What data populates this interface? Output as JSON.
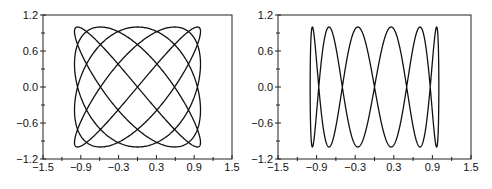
{
  "chart_data": [
    {
      "type": "line",
      "title": "",
      "xlabel": "",
      "ylabel": "",
      "xlim": [
        -1.5,
        1.5
      ],
      "ylim": [
        -1.2,
        1.2
      ],
      "xticks": [
        -1.5,
        -0.9,
        -0.3,
        0.3,
        0.9,
        1.5
      ],
      "xtick_labels": [
        "-1.5",
        "-0.9",
        "-0.3",
        "0.3",
        "0.9",
        "1.5"
      ],
      "xminor_ticks": [
        -1.2,
        -0.6,
        0.0,
        0.6,
        1.2
      ],
      "yticks": [
        -1.2,
        -0.6,
        0.0,
        0.6,
        1.2
      ],
      "ytick_labels": [
        "-1.2",
        "-0.6",
        "0.0",
        "0.6",
        "1.2"
      ],
      "yminor_ticks": [
        -0.9,
        -0.3,
        0.3,
        0.9
      ],
      "grid": false,
      "legend": null,
      "series": [
        {
          "name": "lissajous-5-4",
          "parametric": {
            "x": "sin(4t)",
            "y": "sin(5t + pi/4)",
            "t_range": [
              0,
              6.2832
            ],
            "a": 4,
            "b": 5,
            "phase": 0.7854
          }
        }
      ]
    },
    {
      "type": "line",
      "title": "",
      "xlabel": "",
      "ylabel": "",
      "xlim": [
        -1.5,
        1.5
      ],
      "ylim": [
        -1.2,
        1.2
      ],
      "xticks": [
        -1.5,
        -0.9,
        -0.3,
        0.3,
        0.9,
        1.5
      ],
      "xtick_labels": [
        "-1.5",
        "-0.9",
        "-0.3",
        "0.3",
        "0.9",
        "1.5"
      ],
      "xminor_ticks": [
        -1.2,
        -0.6,
        0.0,
        0.6,
        1.2
      ],
      "yticks": [
        -1.2,
        -0.6,
        0.0,
        0.6,
        1.2
      ],
      "ytick_labels": [
        "-1.2",
        "-0.6",
        "0.0",
        "0.6",
        "1.2"
      ],
      "yminor_ticks": [
        -0.9,
        -0.3,
        0.3,
        0.9
      ],
      "grid": false,
      "legend": null,
      "series": [
        {
          "name": "lissajous-1-6",
          "parametric": {
            "x": "cos(t)",
            "y": "sin(6t)",
            "t_range": [
              0,
              6.2832
            ],
            "a": 1,
            "b": 6,
            "phase": 0
          },
          "peak_x_positions": [
            -0.97,
            -0.71,
            -0.26,
            0.26,
            0.71,
            0.97
          ]
        }
      ]
    }
  ],
  "layout": {
    "panels": [
      {
        "left": 43,
        "top": 15,
        "width": 189,
        "height": 144
      },
      {
        "left": 278,
        "top": 15,
        "width": 193,
        "height": 144
      }
    ],
    "line_color": "#111111",
    "axis_color": "#222222"
  }
}
